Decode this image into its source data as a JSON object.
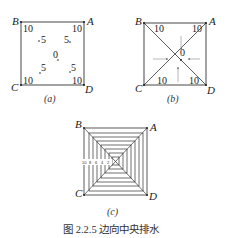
{
  "figure": {
    "caption": "图 2.2.5   边向中央排水",
    "panels": [
      {
        "id": "a",
        "label": "(a)",
        "corners": {
          "A": "A",
          "B": "B",
          "C": "C",
          "D": "D"
        },
        "corner_elevations": {
          "A": "10",
          "B": "10",
          "C": "10",
          "D": "10"
        },
        "interior_points": {
          "upper_left": "5",
          "upper_right": "5",
          "lower_left": "5",
          "lower_right": "5",
          "center": "0"
        }
      },
      {
        "id": "b",
        "label": "(b)",
        "corners": {
          "A": "A",
          "B": "B",
          "C": "C",
          "D": "D"
        },
        "corner_elevations": {
          "A": "10",
          "B": "10",
          "C": "10",
          "D": "10"
        },
        "center": "0",
        "flow_arrows": [
          "from-top",
          "from-bottom",
          "from-left",
          "from-right"
        ]
      },
      {
        "id": "c",
        "label": "(c)",
        "corners": {
          "A": "A",
          "B": "B",
          "C": "C",
          "D": "D"
        },
        "contour_count": 8,
        "contour_labels": [
          "2",
          "4",
          "6",
          "8",
          "10"
        ]
      }
    ]
  }
}
